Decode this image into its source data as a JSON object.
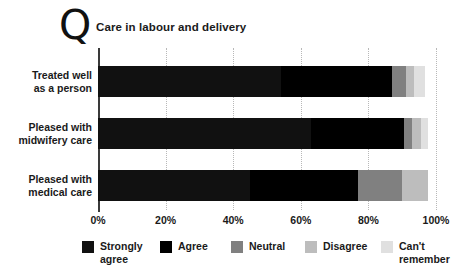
{
  "header": {
    "logo_glyph": "Q",
    "logo_name": "q-letter-logo",
    "title": "Care in labour and delivery"
  },
  "chart_data": {
    "type": "bar",
    "orientation": "horizontal",
    "stacked": true,
    "normalized_percent": true,
    "title": "Care in labour and delivery",
    "xlabel": "",
    "ylabel": "",
    "xlim": [
      0,
      100
    ],
    "xticks": [
      0,
      20,
      40,
      60,
      80,
      100
    ],
    "xticklabels": [
      "0%",
      "20%",
      "40%",
      "60%",
      "80%",
      "100%"
    ],
    "grid": "vertical-dotted",
    "legend_position": "bottom",
    "categories": [
      "Treated well as a person",
      "Pleased with midwifery care",
      "Pleased with medical care"
    ],
    "series": [
      {
        "name": "Strongly agree",
        "color": "#111111",
        "values": [
          54.0,
          63.0,
          45.0
        ]
      },
      {
        "name": "Agree",
        "color": "#000000",
        "values": [
          33.0,
          27.5,
          32.0
        ]
      },
      {
        "name": "Neutral",
        "color": "#808080",
        "values": [
          4.0,
          2.5,
          13.0
        ]
      },
      {
        "name": "Disagree",
        "color": "#bdbdbd",
        "values": [
          2.5,
          2.5,
          7.5
        ]
      },
      {
        "name": "Can't remember",
        "color": "#e0e0e0",
        "values": [
          3.2,
          2.0,
          0.0
        ]
      }
    ]
  },
  "legend": {
    "items": [
      {
        "label": "Strongly\nagree",
        "color": "#111111",
        "name": "legend-strongly-agree"
      },
      {
        "label": "Agree",
        "color": "#000000",
        "name": "legend-agree"
      },
      {
        "label": "Neutral",
        "color": "#808080",
        "name": "legend-neutral"
      },
      {
        "label": "Disagree",
        "color": "#bdbdbd",
        "name": "legend-disagree"
      },
      {
        "label": "Can't\nremember",
        "color": "#e0e0e0",
        "name": "legend-cant-remember"
      }
    ]
  },
  "colors": {
    "axis": "#3a3a3a",
    "grid": "#b8b8b8",
    "text": "#1a1a1a",
    "background": "#ffffff"
  }
}
